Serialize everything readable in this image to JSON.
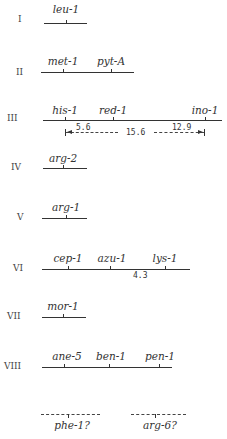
{
  "chromosomes": [
    {
      "label": "I",
      "genes": [
        {
          "name": "leu-1"
        }
      ]
    },
    {
      "label": "II",
      "genes": [
        {
          "name": "met-1"
        },
        {
          "name": "pyt-A"
        }
      ]
    },
    {
      "label": "III",
      "genes": [
        {
          "name": "his-1"
        },
        {
          "name": "red-1"
        },
        {
          "name": "ino-1"
        }
      ],
      "distances": {
        "his_red": "5.6",
        "his_ino": "15.6",
        "red_ino": "12.9"
      }
    },
    {
      "label": "IV",
      "genes": [
        {
          "name": "arg-2"
        }
      ]
    },
    {
      "label": "V",
      "genes": [
        {
          "name": "arg-1"
        }
      ]
    },
    {
      "label": "VI",
      "genes": [
        {
          "name": "cep-1"
        },
        {
          "name": "azu-1"
        },
        {
          "name": "lys-1"
        }
      ],
      "distances": {
        "azu_lys": "4.3"
      }
    },
    {
      "label": "VII",
      "genes": [
        {
          "name": "mor-1"
        }
      ]
    },
    {
      "label": "VIII",
      "genes": [
        {
          "name": "ane-5"
        },
        {
          "name": "ben-1"
        },
        {
          "name": "pen-1"
        }
      ]
    }
  ],
  "unassigned": [
    {
      "name": "phe-1?"
    },
    {
      "name": "arg-6?"
    }
  ]
}
